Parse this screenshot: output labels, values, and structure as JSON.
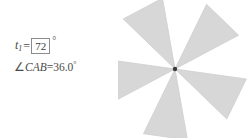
{
  "panel": {
    "slider": {
      "variable": "t",
      "subscript": "1",
      "equals": "=",
      "value": "72",
      "unit": "°"
    },
    "measurement": {
      "angle_symbol": "∠",
      "points": "CAB",
      "equals": "=",
      "value": "36.0",
      "unit": "°",
      "full_text": "∠CAB=36.0°"
    }
  },
  "graphics": {
    "figure_name": "pinwheel",
    "blade_count": 5,
    "blade_fill": "#d7d7d7",
    "blade_stroke": "#cfcfcf",
    "center_point_color": "#3a3a3a",
    "background": "#ffffff",
    "rotation_step_degrees": 72,
    "half_apex_degrees": 18,
    "center": {
      "x": 57,
      "y": 69
    },
    "blade_length": 72,
    "base_angle_degrees": -118,
    "blades": [
      {
        "name": "blade-1",
        "angle": -118
      },
      {
        "name": "blade-2",
        "angle": -46
      },
      {
        "name": "blade-3",
        "angle": 26
      },
      {
        "name": "blade-4",
        "angle": 98
      },
      {
        "name": "blade-5",
        "angle": 170
      }
    ]
  }
}
